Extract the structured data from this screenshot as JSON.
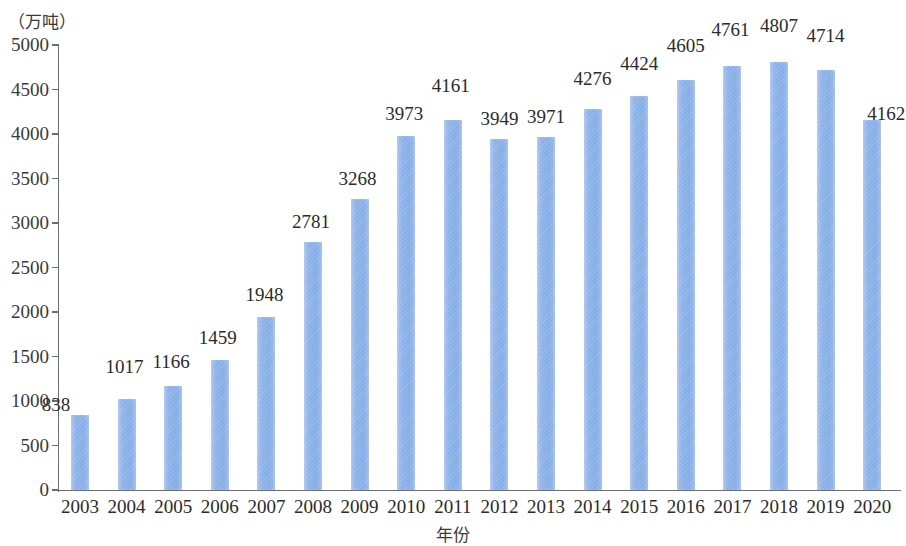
{
  "chart_data": {
    "type": "bar",
    "title": "",
    "subtitle": "",
    "xlabel": "年份",
    "ylabel": "（万吨）",
    "ylim": [
      0,
      5000
    ],
    "ytick_step": 500,
    "yticks": [
      "5000",
      "4500",
      "4000",
      "3500",
      "3000",
      "2500",
      "2000",
      "1500",
      "1000",
      "500",
      "0"
    ],
    "grid": false,
    "legend": null,
    "bar_color": "#8cb2e8",
    "categories": [
      "2003",
      "2004",
      "2005",
      "2006",
      "2007",
      "2008",
      "2009",
      "2010",
      "2011",
      "2012",
      "2013",
      "2014",
      "2015",
      "2016",
      "2017",
      "2018",
      "2019",
      "2020"
    ],
    "values": [
      838,
      1017,
      1166,
      1459,
      1948,
      2781,
      3268,
      3973,
      4161,
      3949,
      3971,
      4276,
      4424,
      4605,
      4761,
      4807,
      4714,
      4162
    ],
    "value_labels": [
      "838",
      "1017",
      "1166",
      "1459",
      "1948",
      "2781",
      "3268",
      "3973",
      "4161",
      "3949",
      "3971",
      "4276",
      "4424",
      "4605",
      "4761",
      "4807",
      "4714",
      "4162"
    ]
  }
}
